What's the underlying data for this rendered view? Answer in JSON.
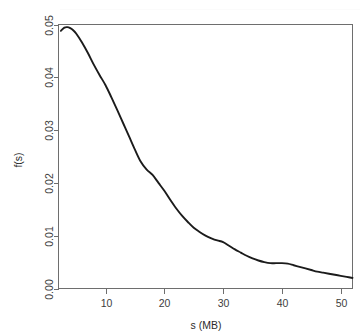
{
  "page": {
    "background_color": "#ffffff",
    "partial_header_text": "",
    "width": 364,
    "height": 335
  },
  "chart_data": {
    "type": "line",
    "title": "",
    "subtitle": "",
    "xlabel": "s (MB)",
    "ylabel": "f(s)",
    "xlim": [
      2,
      52
    ],
    "ylim": [
      0.0,
      0.05
    ],
    "grid": false,
    "legend": null,
    "legend_position": "none",
    "line_color": "#1b1b1b",
    "line_width": 1.9,
    "box_border_color": "#6e6e6e",
    "x_ticks": [
      10,
      20,
      30,
      40,
      50
    ],
    "x_tick_labels": [
      "10",
      "20",
      "30",
      "40",
      "50"
    ],
    "y_ticks": [
      0.0,
      0.01,
      0.02,
      0.03,
      0.04,
      0.05
    ],
    "y_tick_labels": [
      "0.00",
      "0.01",
      "0.02",
      "0.03",
      "0.04",
      "0.05"
    ],
    "y_tick_label_rotation": -90,
    "annotations": [
      "peak near s = 3.5 MB at f(s) = 0.0495",
      "shoulder/inflection near s = 18 MB at f(s) = 0.0215",
      "small plateau near s = 38-41 MB at f(s) = 0.0048"
    ],
    "x": [
      2.4,
      3.0,
      3.5,
      4.0,
      4.5,
      5.0,
      6.0,
      7.0,
      8.0,
      9.0,
      10.0,
      11.0,
      12.0,
      13.0,
      14.0,
      15.0,
      16.0,
      17.0,
      18.0,
      19.0,
      20.0,
      21.0,
      22.0,
      23.0,
      24.0,
      25.0,
      26.0,
      27.0,
      28.0,
      29.0,
      30.0,
      31.0,
      32.0,
      33.0,
      34.0,
      35.0,
      36.0,
      37.0,
      38.0,
      39.0,
      40.0,
      41.0,
      42.0,
      43.0,
      44.0,
      45.0,
      46.0,
      47.0,
      48.0,
      49.0,
      50.0,
      51.0,
      52.0
    ],
    "y": [
      0.0488,
      0.0494,
      0.0495,
      0.0493,
      0.0489,
      0.0483,
      0.0466,
      0.0446,
      0.0424,
      0.0404,
      0.0385,
      0.0362,
      0.0338,
      0.0313,
      0.0288,
      0.0263,
      0.024,
      0.0225,
      0.0215,
      0.02,
      0.0185,
      0.0168,
      0.0152,
      0.0138,
      0.0126,
      0.0115,
      0.0107,
      0.01,
      0.0095,
      0.0091,
      0.0088,
      0.0081,
      0.0074,
      0.0068,
      0.0062,
      0.0057,
      0.0053,
      0.005,
      0.0048,
      0.0048,
      0.0048,
      0.0047,
      0.0044,
      0.0041,
      0.0038,
      0.0035,
      0.0032,
      0.003,
      0.0028,
      0.0026,
      0.0024,
      0.0022,
      0.002
    ],
    "series": [
      {
        "name": "f(s)",
        "values": [
          0.0488,
          0.0494,
          0.0495,
          0.0493,
          0.0489,
          0.0483,
          0.0466,
          0.0446,
          0.0424,
          0.0404,
          0.0385,
          0.0362,
          0.0338,
          0.0313,
          0.0288,
          0.0263,
          0.024,
          0.0225,
          0.0215,
          0.02,
          0.0185,
          0.0168,
          0.0152,
          0.0138,
          0.0126,
          0.0115,
          0.0107,
          0.01,
          0.0095,
          0.0091,
          0.0088,
          0.0081,
          0.0074,
          0.0068,
          0.0062,
          0.0057,
          0.0053,
          0.005,
          0.0048,
          0.0048,
          0.0048,
          0.0047,
          0.0044,
          0.0041,
          0.0038,
          0.0035,
          0.0032,
          0.003,
          0.0028,
          0.0026,
          0.0024,
          0.0022,
          0.002
        ]
      }
    ]
  }
}
